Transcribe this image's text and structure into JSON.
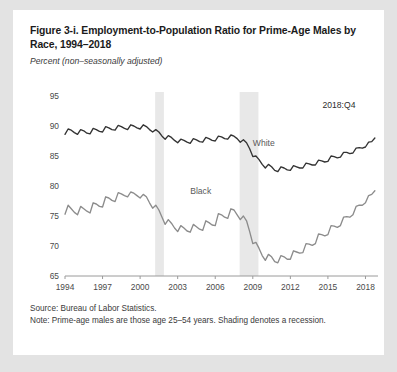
{
  "figure": {
    "title": "Figure 3-i. Employment-to-Population Ratio for Prime-Age Males by Race, 1994–2018",
    "subtitle": "Percent (non–seasonally adjusted)",
    "source": "Source: Bureau of Labor Statistics.",
    "note": "Note: Prime-age males are those age 25–54 years. Shading denotes a recession.",
    "annotation": "2018:Q4",
    "colors": {
      "page_background": "#e3e3e3",
      "card_background": "#ffffff",
      "white_series_line": "#333333",
      "black_series_line": "#8c8c8c",
      "recession_shading": "#e8e8e8",
      "axis": "#9a9a9a",
      "text": "#1b1b1b"
    }
  },
  "chart_data": {
    "type": "line",
    "title": "Figure 3-i. Employment-to-Population Ratio for Prime-Age Males by Race, 1994–2018",
    "xlabel": "",
    "ylabel": "Percent (non-seasonally adjusted)",
    "xlim": [
      1994,
      2019
    ],
    "ylim": [
      65,
      95
    ],
    "yticks": [
      65,
      70,
      75,
      80,
      85,
      90,
      95
    ],
    "xticks": [
      1994,
      1997,
      2000,
      2003,
      2006,
      2009,
      2012,
      2015,
      2018
    ],
    "grid": false,
    "legend_position": "inline-labels",
    "annotations": [
      {
        "text": "2018:Q4",
        "x": 2017.2,
        "y": 93.0
      },
      {
        "text": "White",
        "x": 2009.0,
        "y": 86.6
      },
      {
        "text": "Black",
        "x": 2004.0,
        "y": 78.6
      }
    ],
    "shaded_regions": [
      {
        "label": "2001 recession",
        "x0": 2001.2,
        "x1": 2001.9
      },
      {
        "label": "2007-2009 recession",
        "x0": 2007.95,
        "x1": 2009.45
      }
    ],
    "x": [
      1994.0,
      1994.25,
      1994.5,
      1994.75,
      1995.0,
      1995.25,
      1995.5,
      1995.75,
      1996.0,
      1996.25,
      1996.5,
      1996.75,
      1997.0,
      1997.25,
      1997.5,
      1997.75,
      1998.0,
      1998.25,
      1998.5,
      1998.75,
      1999.0,
      1999.25,
      1999.5,
      1999.75,
      2000.0,
      2000.25,
      2000.5,
      2000.75,
      2001.0,
      2001.25,
      2001.5,
      2001.75,
      2002.0,
      2002.25,
      2002.5,
      2002.75,
      2003.0,
      2003.25,
      2003.5,
      2003.75,
      2004.0,
      2004.25,
      2004.5,
      2004.75,
      2005.0,
      2005.25,
      2005.5,
      2005.75,
      2006.0,
      2006.25,
      2006.5,
      2006.75,
      2007.0,
      2007.25,
      2007.5,
      2007.75,
      2008.0,
      2008.25,
      2008.5,
      2008.75,
      2009.0,
      2009.25,
      2009.5,
      2009.75,
      2010.0,
      2010.25,
      2010.5,
      2010.75,
      2011.0,
      2011.25,
      2011.5,
      2011.75,
      2012.0,
      2012.25,
      2012.5,
      2012.75,
      2013.0,
      2013.25,
      2013.5,
      2013.75,
      2014.0,
      2014.25,
      2014.5,
      2014.75,
      2015.0,
      2015.25,
      2015.5,
      2015.75,
      2016.0,
      2016.25,
      2016.5,
      2016.75,
      2017.0,
      2017.25,
      2017.5,
      2017.75,
      2018.0,
      2018.25,
      2018.5,
      2018.75
    ],
    "series": [
      {
        "name": "White",
        "color": "#333333",
        "values": [
          88.6,
          89.5,
          89.3,
          88.9,
          88.6,
          89.4,
          89.2,
          88.8,
          88.7,
          89.6,
          89.4,
          89.1,
          89.0,
          89.9,
          89.7,
          89.4,
          89.3,
          90.1,
          89.9,
          89.6,
          89.4,
          90.2,
          90.0,
          89.7,
          89.5,
          90.2,
          89.9,
          89.4,
          89.0,
          89.4,
          89.0,
          88.3,
          87.8,
          88.4,
          88.1,
          87.6,
          87.2,
          87.8,
          87.6,
          87.3,
          87.1,
          87.9,
          87.7,
          87.4,
          87.3,
          88.1,
          87.9,
          87.6,
          87.5,
          88.3,
          88.2,
          87.9,
          87.8,
          88.5,
          88.3,
          87.9,
          87.3,
          87.7,
          87.2,
          86.2,
          84.9,
          85.0,
          84.4,
          83.6,
          83.0,
          83.6,
          83.2,
          82.6,
          82.4,
          83.2,
          83.0,
          82.7,
          82.6,
          83.4,
          83.2,
          83.0,
          83.0,
          83.8,
          83.7,
          83.5,
          83.5,
          84.3,
          84.2,
          84.0,
          84.1,
          85.0,
          84.9,
          84.7,
          84.8,
          85.6,
          85.6,
          85.4,
          85.5,
          86.3,
          86.4,
          86.3,
          86.5,
          87.3,
          87.4,
          88.0
        ]
      },
      {
        "name": "Black",
        "color": "#8c8c8c",
        "values": [
          75.3,
          76.8,
          76.2,
          75.6,
          75.2,
          76.6,
          76.2,
          75.8,
          75.5,
          77.2,
          77.0,
          76.6,
          76.5,
          78.2,
          78.0,
          77.6,
          77.4,
          78.9,
          78.7,
          78.4,
          78.2,
          79.0,
          78.8,
          78.4,
          78.0,
          78.6,
          78.2,
          77.2,
          76.3,
          76.8,
          76.0,
          74.8,
          73.6,
          74.4,
          73.8,
          73.0,
          72.4,
          73.4,
          73.0,
          72.5,
          72.3,
          73.6,
          73.2,
          72.8,
          72.6,
          74.2,
          73.9,
          73.5,
          73.4,
          75.4,
          75.2,
          74.8,
          74.6,
          76.2,
          76.0,
          75.2,
          74.4,
          75.0,
          74.2,
          72.4,
          70.4,
          70.6,
          69.6,
          68.4,
          67.6,
          68.6,
          68.2,
          67.4,
          67.2,
          68.4,
          68.2,
          67.8,
          67.8,
          69.2,
          69.0,
          68.8,
          68.9,
          70.4,
          70.3,
          70.1,
          70.4,
          72.0,
          71.9,
          71.7,
          71.9,
          73.4,
          73.3,
          73.1,
          73.4,
          74.8,
          74.9,
          74.8,
          75.2,
          76.6,
          76.8,
          76.8,
          77.2,
          78.4,
          78.6,
          79.2
        ]
      }
    ]
  }
}
